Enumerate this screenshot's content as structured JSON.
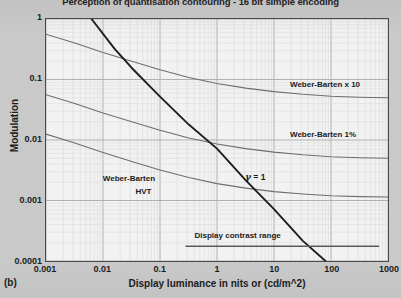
{
  "chart_data": {
    "type": "line",
    "title": "Perception of quantisation contouring - 16 bit simple encoding",
    "panel_label": "(b)",
    "xlabel": "Display luminance in nits or (cd/m^2)",
    "ylabel": "Modulation",
    "xscale": "log",
    "yscale": "log",
    "xlim": [
      0.001,
      1000
    ],
    "ylim": [
      0.0001,
      1
    ],
    "grid": true,
    "grid_minor": true,
    "legend_position": "inline-annotations",
    "xticks": [
      "0.001",
      "0.01",
      "0.1",
      "1",
      "10",
      "100",
      "1000"
    ],
    "xtick_values": [
      0.001,
      0.01,
      0.1,
      1,
      10,
      100,
      1000
    ],
    "yticks": [
      "1",
      "0.1",
      "0.01",
      "0.001",
      "0.0001"
    ],
    "ytick_values": [
      1,
      0.1,
      0.01,
      0.001,
      0.0001
    ],
    "series": [
      {
        "name": "Weber-Barten x 10",
        "color": "#6e6e6e",
        "x": [
          0.001,
          0.0032,
          0.01,
          0.032,
          0.1,
          0.32,
          1,
          3.2,
          10,
          32,
          100,
          320,
          1000
        ],
        "y": [
          0.56,
          0.4,
          0.28,
          0.2,
          0.145,
          0.108,
          0.086,
          0.072,
          0.063,
          0.057,
          0.053,
          0.051,
          0.05
        ]
      },
      {
        "name": "Weber-Barten 1%",
        "color": "#6e6e6e",
        "x": [
          0.001,
          0.0032,
          0.01,
          0.032,
          0.1,
          0.32,
          1,
          3.2,
          10,
          32,
          100,
          320,
          1000
        ],
        "y": [
          0.056,
          0.04,
          0.028,
          0.02,
          0.0145,
          0.0108,
          0.0086,
          0.0072,
          0.0063,
          0.0057,
          0.0053,
          0.0051,
          0.005
        ]
      },
      {
        "name": "Weber-Barten HVT",
        "color": "#6e6e6e",
        "x": [
          0.001,
          0.0032,
          0.01,
          0.032,
          0.1,
          0.32,
          1,
          3.2,
          10,
          32,
          100,
          320,
          1000
        ],
        "y": [
          0.0125,
          0.0089,
          0.0062,
          0.0044,
          0.0032,
          0.0024,
          0.0019,
          0.0016,
          0.0014,
          0.00128,
          0.0012,
          0.00116,
          0.00114
        ]
      },
      {
        "name": "gamma = 1",
        "color": "#1e1e1e",
        "x": [
          0.0063,
          0.016,
          0.032,
          0.1,
          0.32,
          1,
          3.2,
          10,
          32,
          80
        ],
        "y": [
          1.0,
          0.32,
          0.155,
          0.052,
          0.018,
          0.0072,
          0.00215,
          0.00072,
          0.000215,
          0.0001
        ]
      }
    ],
    "annotations": [
      {
        "text": "Weber-Barten x 10",
        "x": 18,
        "y": 0.083
      },
      {
        "text": "Weber-Barten 1%",
        "x": 18,
        "y": 0.0125
      },
      {
        "text": "Weber-Barten",
        "x": 0.028,
        "y": 0.0024
      },
      {
        "text": "HVT",
        "x": 0.05,
        "y": 0.00145
      },
      {
        "text": "= 1",
        "symbol": "γ",
        "x": 3.0,
        "y": 0.0026
      },
      {
        "text": "Display contrast range",
        "x": 2.2,
        "y": 0.00028
      }
    ],
    "markers": [
      {
        "name": "display-contrast-range-bar",
        "type": "hline",
        "y": 0.000175,
        "x_start": 0.28,
        "x_end": 700,
        "color": "#5a5a5a"
      }
    ]
  }
}
